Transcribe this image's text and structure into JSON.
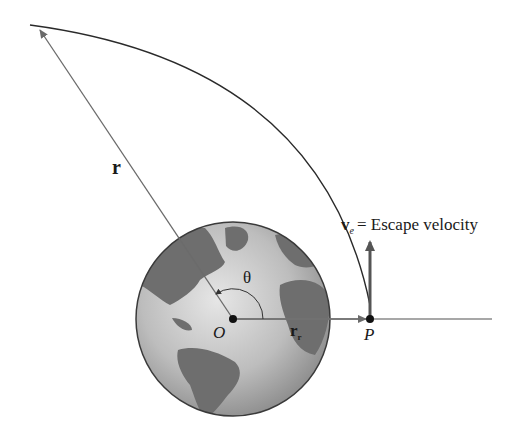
{
  "diagram": {
    "labels": {
      "r": "r",
      "theta": "θ",
      "origin": "O",
      "r0": "r",
      "r0_sub": "r",
      "point_p": "P",
      "ve": "v",
      "ve_sub": "e",
      "ve_text": "= Escape velocity"
    },
    "colors": {
      "line": "#6b6b6b",
      "curve": "#2a2a2a",
      "earth_ocean": "#c8c8c8",
      "earth_land": "#6a6a6a",
      "earth_outline": "#3a3a3a",
      "text": "#1a1a1a"
    },
    "geometry": {
      "origin": [
        233,
        319
      ],
      "earth_radius": 97,
      "point_p": [
        370,
        319
      ],
      "r_tip": [
        38,
        27
      ],
      "baseline_end": [
        492,
        319
      ],
      "ve_tip": [
        370,
        240
      ]
    }
  }
}
